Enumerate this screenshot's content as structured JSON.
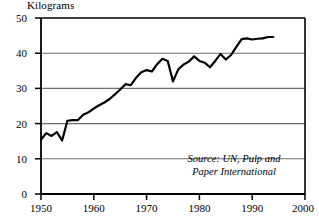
{
  "chart_data": {
    "type": "line",
    "title": "",
    "ylabel": "Kilograms",
    "xlabel": "",
    "xlim": [
      1950,
      2000
    ],
    "ylim": [
      0,
      50
    ],
    "grid": "horizontal",
    "legend": "none",
    "yticks": [
      0,
      10,
      20,
      30,
      40,
      50
    ],
    "xticks": [
      1950,
      1960,
      1970,
      1980,
      1990,
      2000
    ],
    "ytick_labels": [
      "0",
      "10",
      "20",
      "30",
      "40",
      "50"
    ],
    "xtick_labels": [
      "1950",
      "1960",
      "1970",
      "1980",
      "1990",
      "2000"
    ],
    "series": [
      {
        "name": "Paper consumption per capita",
        "x": [
          1950,
          1951,
          1952,
          1953,
          1954,
          1955,
          1956,
          1957,
          1958,
          1959,
          1960,
          1961,
          1962,
          1963,
          1964,
          1965,
          1966,
          1967,
          1968,
          1969,
          1970,
          1971,
          1972,
          1973,
          1974,
          1975,
          1976,
          1977,
          1978,
          1979,
          1980,
          1981,
          1982,
          1983,
          1984,
          1985,
          1986,
          1987,
          1988,
          1989,
          1990,
          1991,
          1992,
          1993,
          1994
        ],
        "values": [
          15.5,
          17.3,
          16.5,
          17.6,
          15.2,
          20.8,
          21.0,
          21.0,
          22.5,
          23.2,
          24.3,
          25.2,
          26.0,
          27.0,
          28.3,
          29.7,
          31.2,
          30.9,
          33.0,
          34.6,
          35.2,
          34.8,
          36.9,
          38.4,
          37.8,
          32.0,
          35.4,
          36.8,
          37.6,
          39.1,
          37.8,
          37.3,
          36.0,
          37.8,
          39.8,
          38.2,
          39.5,
          41.8,
          44.0,
          44.2,
          43.9,
          44.1,
          44.2,
          44.6,
          44.6
        ]
      }
    ],
    "annotations": [
      {
        "name": "source-note",
        "text_line_1": "Source: UN, Pulp and",
        "text_line_2": "Paper International"
      }
    ]
  },
  "axes": {
    "ylabel": "Kilograms",
    "ytick_labels": [
      "50",
      "40",
      "30",
      "20",
      "10",
      "0"
    ],
    "xtick_labels": [
      "1950",
      "1960",
      "1970",
      "1980",
      "1990",
      "2000"
    ]
  },
  "source": {
    "line1": "Source: UN, Pulp and",
    "line2": "Paper International"
  },
  "colors": {
    "line": "#000000",
    "grid": "#6e6e6e",
    "axis": "#000000",
    "background": "#ffffff"
  }
}
